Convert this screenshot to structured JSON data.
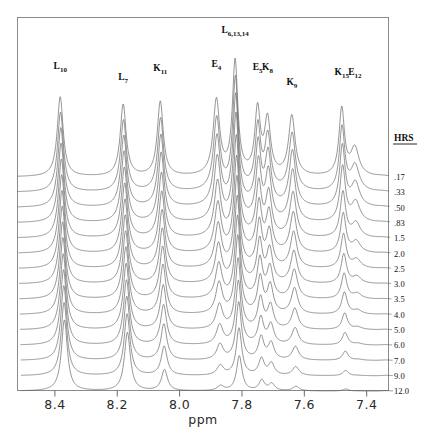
{
  "figure": {
    "kind": "nmr-stack-plot",
    "axis": {
      "xlabel": "ppm",
      "ticks": [
        "8.4",
        "8.2",
        "8.0",
        "7.8",
        "7.6",
        "7.4"
      ],
      "xlim": [
        8.52,
        7.33
      ],
      "direction": "decreasing"
    },
    "time_column": {
      "header": "HRS",
      "values": [
        ".17",
        ".33",
        ".50",
        ".83",
        "1.5",
        "2.0",
        "2.5",
        "3.0",
        "3.5",
        "4.0",
        "5.0",
        "6.0",
        "7.0",
        "9.0",
        "12.0"
      ]
    },
    "peak_labels": [
      {
        "text": "L",
        "sub": "10",
        "ppm": 8.383,
        "label_y": 69
      },
      {
        "text": "L",
        "sub": "7",
        "ppm": 8.181,
        "label_y": 80
      },
      {
        "text": "K",
        "sub": "11",
        "ppm": 8.062,
        "label_y": 71
      },
      {
        "text": "E",
        "sub": "4",
        "ppm": 7.882,
        "label_y": 67
      },
      {
        "text": "L",
        "sub": "6,13,14",
        "ppm": 7.822,
        "label_y": 33
      },
      {
        "text": "E",
        "sub": "5",
        "ppm": 7.75,
        "label_y": 70
      },
      {
        "text": "K",
        "sub": "8",
        "ppm": 7.718,
        "label_y": 70
      },
      {
        "text": "K",
        "sub": "9",
        "ppm": 7.64,
        "label_y": 85
      },
      {
        "text": "K",
        "sub": "15",
        "ppm": 7.48,
        "label_y": 75
      },
      {
        "text": "E",
        "sub": "12",
        "ppm": 7.438,
        "label_y": 75
      }
    ]
  },
  "chart_data": {
    "type": "line",
    "title": "",
    "xlabel": "ppm",
    "ylabel": "",
    "xlim": [
      8.52,
      7.33
    ],
    "grid": false,
    "legend": "right",
    "x_ticks": [
      8.4,
      8.2,
      8.0,
      7.8,
      7.6,
      7.4
    ],
    "series_label_header": "HRS",
    "series": [
      {
        "name": ".17",
        "hours": 0.17
      },
      {
        "name": ".33",
        "hours": 0.33
      },
      {
        "name": ".50",
        "hours": 0.5
      },
      {
        "name": ".83",
        "hours": 0.83
      },
      {
        "name": "1.5",
        "hours": 1.5
      },
      {
        "name": "2.0",
        "hours": 2.0
      },
      {
        "name": "2.5",
        "hours": 2.5
      },
      {
        "name": "3.0",
        "hours": 3.0
      },
      {
        "name": "3.5",
        "hours": 3.5
      },
      {
        "name": "4.0",
        "hours": 4.0
      },
      {
        "name": "5.0",
        "hours": 5.0
      },
      {
        "name": "6.0",
        "hours": 6.0
      },
      {
        "name": "7.0",
        "hours": 7.0
      },
      {
        "name": "9.0",
        "hours": 9.0
      },
      {
        "name": "12.0",
        "hours": 12.0
      }
    ],
    "peaks": [
      {
        "label": "L10",
        "ppm": 8.383,
        "width": 0.0115,
        "amp0": 80,
        "halflife_hrs": 70.0
      },
      {
        "label": "L7",
        "ppm": 8.181,
        "width": 0.0115,
        "amp0": 72,
        "halflife_hrs": 40.0
      },
      {
        "label": "K11",
        "ppm": 8.062,
        "width": 0.0115,
        "amp0": 76,
        "halflife_hrs": 6.5
      },
      {
        "label": "E4",
        "ppm": 7.882,
        "width": 0.0125,
        "amp0": 78,
        "halflife_hrs": 3.0
      },
      {
        "label": "L6,13,14",
        "ppm": 7.822,
        "width": 0.0105,
        "amp0": 115,
        "halflife_hrs": 7.0
      },
      {
        "label": "E5",
        "ppm": 7.75,
        "width": 0.0105,
        "amp0": 66,
        "halflife_hrs": 4.5
      },
      {
        "label": "K8",
        "ppm": 7.718,
        "width": 0.0115,
        "amp0": 56,
        "halflife_hrs": 4.0
      },
      {
        "label": "K9",
        "ppm": 7.64,
        "width": 0.0125,
        "amp0": 62,
        "halflife_hrs": 3.2
      },
      {
        "label": "K15",
        "ppm": 7.48,
        "width": 0.0105,
        "amp0": 70,
        "halflife_hrs": 2.4
      },
      {
        "label": "E12",
        "ppm": 7.438,
        "width": 0.016,
        "amp0": 30,
        "halflife_hrs": 1.4
      }
    ]
  }
}
